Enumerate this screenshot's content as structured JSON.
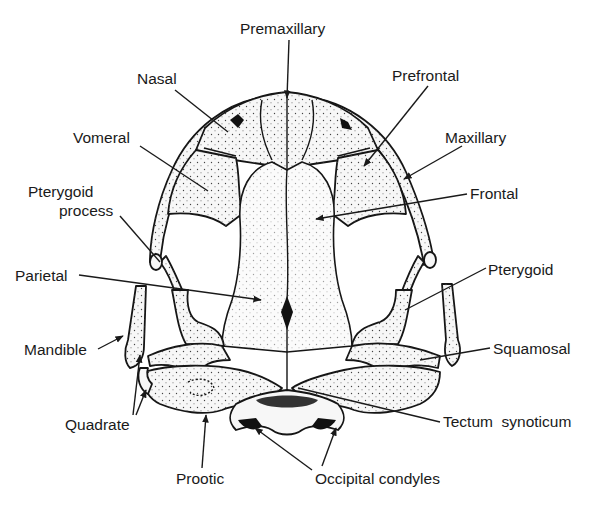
{
  "figure": {
    "labels": [
      {
        "id": "premaxillary",
        "text": "Premaxillary",
        "x": 240,
        "y": 34,
        "target": [
          287,
          98
        ]
      },
      {
        "id": "nasal",
        "text": "Nasal",
        "x": 137,
        "y": 84,
        "target": [
          228,
          132
        ]
      },
      {
        "id": "prefrontal",
        "text": "Prefrontal",
        "x": 392,
        "y": 81,
        "target": [
          364,
          166
        ]
      },
      {
        "id": "maxillary",
        "text": "Maxillary",
        "x": 445,
        "y": 143,
        "target": [
          404,
          179
        ]
      },
      {
        "id": "vomeral",
        "text": "Vomeral",
        "x": 73,
        "y": 143,
        "target": [
          208,
          191
        ]
      },
      {
        "id": "frontal",
        "text": "Frontal",
        "x": 470,
        "y": 199,
        "target": [
          316,
          219
        ]
      },
      {
        "id": "pterygoid-process",
        "text": "Pterygoid\nprocess",
        "x": 28,
        "y": 197,
        "target": [
          172,
          268
        ]
      },
      {
        "id": "parietal",
        "text": "Parietal",
        "x": 15,
        "y": 281,
        "target": [
          261,
          300
        ]
      },
      {
        "id": "pterygoid",
        "text": "Pterygoid",
        "x": 488,
        "y": 275,
        "target": [
          405,
          310
        ]
      },
      {
        "id": "mandible",
        "text": "Mandible",
        "x": 24,
        "y": 355,
        "target": [
          123,
          336
        ]
      },
      {
        "id": "squamosal",
        "text": "Squamosal",
        "x": 493,
        "y": 354,
        "target": [
          420,
          360
        ]
      },
      {
        "id": "quadrate",
        "text": "Quadrate",
        "x": 65,
        "y": 430,
        "targets": [
          [
            140,
            355
          ],
          [
            146,
            390
          ]
        ]
      },
      {
        "id": "tectum-synoticum",
        "text": "Tectum  synoticum",
        "x": 443,
        "y": 427,
        "target": [
          298,
          388
        ]
      },
      {
        "id": "prootic",
        "text": "Prootic",
        "x": 176,
        "y": 484,
        "target": [
          206,
          415
        ]
      },
      {
        "id": "occipital-condyles",
        "text": "Occipital condyles",
        "x": 315,
        "y": 484,
        "targets": [
          [
            255,
            428
          ],
          [
            336,
            428
          ]
        ]
      }
    ]
  }
}
